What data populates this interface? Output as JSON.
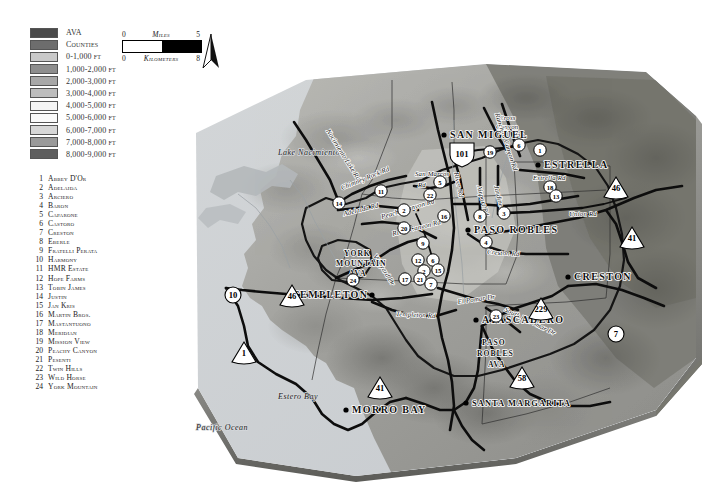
{
  "legend": {
    "title": "Map Legend",
    "items": [
      {
        "label": "AVA",
        "color": "#4a4a4a"
      },
      {
        "label": "Counties",
        "color": "#6d6d6d"
      },
      {
        "label": "0-1,000 ft",
        "color": "#c9c9c9"
      },
      {
        "label": "1,000-2,000 ft",
        "color": "#8e8e8e"
      },
      {
        "label": "2,000-3,000 ft",
        "color": "#a8a8a8"
      },
      {
        "label": "3,000-4,000 ft",
        "color": "#bdbdbd"
      },
      {
        "label": "4,000-5,000 ft",
        "color": "#f4f4f4"
      },
      {
        "label": "5,000-6,000 ft",
        "color": "#fafafa"
      },
      {
        "label": "6,000-7,000 ft",
        "color": "#d7d7d7"
      },
      {
        "label": "7,000-8,000 ft",
        "color": "#9a9a9a"
      },
      {
        "label": "8,000-9,000 ft",
        "color": "#5e5e5e"
      }
    ]
  },
  "scalebar": {
    "miles_min": "0",
    "miles_label": "Miles",
    "miles_max": "5",
    "km_min": "0",
    "km_label": "Kilometers",
    "km_max": "8"
  },
  "north_arrow": {
    "name": "north-arrow"
  },
  "wineries": [
    {
      "num": "1",
      "name": "Abbey D'Or"
    },
    {
      "num": "2",
      "name": "Adelaida"
    },
    {
      "num": "3",
      "name": "Arciero"
    },
    {
      "num": "4",
      "name": "Baron"
    },
    {
      "num": "5",
      "name": "Caparone"
    },
    {
      "num": "6",
      "name": "Castoro"
    },
    {
      "num": "7",
      "name": "Creston"
    },
    {
      "num": "8",
      "name": "Eberle"
    },
    {
      "num": "9",
      "name": "Fratelli Perata"
    },
    {
      "num": "10",
      "name": "Harmony"
    },
    {
      "num": "11",
      "name": "HMR Estate"
    },
    {
      "num": "12",
      "name": "Hope Farms"
    },
    {
      "num": "13",
      "name": "Tobin James"
    },
    {
      "num": "14",
      "name": "Justin"
    },
    {
      "num": "15",
      "name": "Jan Kris"
    },
    {
      "num": "16",
      "name": "Martin Bros."
    },
    {
      "num": "17",
      "name": "Mastantuono"
    },
    {
      "num": "18",
      "name": "Meridian"
    },
    {
      "num": "19",
      "name": "Mission View"
    },
    {
      "num": "20",
      "name": "Peachy Canyon"
    },
    {
      "num": "21",
      "name": "Pesenti"
    },
    {
      "num": "22",
      "name": "Twin Hills"
    },
    {
      "num": "23",
      "name": "Wild Horse"
    },
    {
      "num": "24",
      "name": "York Mountain"
    }
  ],
  "map": {
    "cities": [
      {
        "name": "SAN MIGUEL",
        "x": 258,
        "y": 80,
        "size": "large",
        "dot": true,
        "dx": 6
      },
      {
        "name": "ESTRELLA",
        "x": 352,
        "y": 110,
        "size": "large",
        "dot": true,
        "dx": 6
      },
      {
        "name": "PASO ROBLES",
        "x": 282,
        "y": 175,
        "size": "large",
        "dot": true,
        "dx": 6
      },
      {
        "name": "TEMPLETON",
        "x": 186,
        "y": 240,
        "size": "large",
        "dot": true,
        "dx": -80
      },
      {
        "name": "CRESTON",
        "x": 382,
        "y": 222,
        "size": "large",
        "dot": true,
        "dx": 6
      },
      {
        "name": "ATASCADERO",
        "x": 290,
        "y": 265,
        "size": "large",
        "dot": true,
        "dx": 6
      },
      {
        "name": "MORRO BAY",
        "x": 160,
        "y": 355,
        "size": "large",
        "dot": true,
        "dx": 6
      },
      {
        "name": "SANTA MARGARITA",
        "x": 280,
        "y": 348,
        "size": "small",
        "dot": true,
        "dx": 6
      }
    ],
    "water_labels": [
      {
        "name": "Lake Nacimiento",
        "x": 92,
        "y": 97,
        "rot": 0
      },
      {
        "name": "Estero Bay",
        "x": 92,
        "y": 341,
        "rot": 0
      },
      {
        "name": "Pacific Ocean",
        "x": 10,
        "y": 372,
        "rot": 0
      }
    ],
    "ava_labels": [
      {
        "name": "YORK",
        "x": 158,
        "y": 198
      },
      {
        "name": "MOUNTAIN",
        "x": 150,
        "y": 208
      },
      {
        "name": "AVA",
        "x": 163,
        "y": 218
      },
      {
        "name": "PASO",
        "x": 296,
        "y": 287
      },
      {
        "name": "ROBLES",
        "x": 291,
        "y": 298
      },
      {
        "name": "AVA",
        "x": 302,
        "y": 309
      }
    ],
    "road_labels": [
      {
        "name": "Nacimiento Lake Rd",
        "x": 140,
        "y": 73,
        "rot": 58
      },
      {
        "name": "Chimney Rock Rd",
        "x": 156,
        "y": 132,
        "rot": -22
      },
      {
        "name": "Adelaida Rd",
        "x": 158,
        "y": 158,
        "rot": -14
      },
      {
        "name": "Peachy Canyon Rd",
        "x": 196,
        "y": 161,
        "rot": -17
      },
      {
        "name": "San Marcos",
        "x": 229,
        "y": 118,
        "rot": 0
      },
      {
        "name": "Rd",
        "x": 232,
        "y": 129,
        "rot": 0
      },
      {
        "name": "Cross",
        "x": 313,
        "y": 62,
        "rot": 0
      },
      {
        "name": "Canyon",
        "x": 310,
        "y": 71,
        "rot": 0
      },
      {
        "name": "Rd",
        "x": 330,
        "y": 80,
        "rot": 0
      },
      {
        "name": "Ranchita Canyon Rd",
        "x": 309,
        "y": 56,
        "rot": 72
      },
      {
        "name": "River Rd",
        "x": 268,
        "y": 115,
        "rot": 78
      },
      {
        "name": "Airport Rd",
        "x": 291,
        "y": 128,
        "rot": 76
      },
      {
        "name": "Jardine Rd",
        "x": 308,
        "y": 128,
        "rot": 76
      },
      {
        "name": "Estrella Rd",
        "x": 347,
        "y": 122,
        "rot": 0
      },
      {
        "name": "Union Rd",
        "x": 383,
        "y": 158,
        "rot": 0
      },
      {
        "name": "Creston Rd",
        "x": 301,
        "y": 196,
        "rot": 4
      },
      {
        "name": "River Canyon Rd",
        "x": 207,
        "y": 178,
        "rot": -14
      },
      {
        "name": "Vineyard Dr",
        "x": 187,
        "y": 198,
        "rot": 58
      },
      {
        "name": "El Pomar Dr",
        "x": 272,
        "y": 246,
        "rot": -8
      },
      {
        "name": "South El Pomar Dr",
        "x": 318,
        "y": 253,
        "rot": 26
      },
      {
        "name": "Templeton Rd",
        "x": 210,
        "y": 258,
        "rot": 3
      }
    ],
    "highway_shields": [
      {
        "num": "101",
        "x": 276,
        "y": 96,
        "shape": "us"
      },
      {
        "num": "46",
        "x": 430,
        "y": 130,
        "shape": "state"
      },
      {
        "num": "41",
        "x": 446,
        "y": 180,
        "shape": "state"
      },
      {
        "num": "229",
        "x": 355,
        "y": 251,
        "shape": "state"
      },
      {
        "num": "58",
        "x": 336,
        "y": 320,
        "shape": "state"
      },
      {
        "num": "7",
        "x": 430,
        "y": 276,
        "shape": "circle"
      },
      {
        "num": "46",
        "x": 106,
        "y": 238,
        "shape": "state"
      },
      {
        "num": "10",
        "x": 47,
        "y": 237,
        "shape": "circle"
      },
      {
        "num": "1",
        "x": 58,
        "y": 295,
        "shape": "state"
      },
      {
        "num": "41",
        "x": 194,
        "y": 330,
        "shape": "state"
      }
    ],
    "winery_markers": [
      {
        "num": "14",
        "x": 153,
        "y": 145
      },
      {
        "num": "11",
        "x": 195,
        "y": 133
      },
      {
        "num": "2",
        "x": 218,
        "y": 152
      },
      {
        "num": "5",
        "x": 254,
        "y": 124
      },
      {
        "num": "22",
        "x": 244,
        "y": 137
      },
      {
        "num": "19",
        "x": 304,
        "y": 94
      },
      {
        "num": "6",
        "x": 333,
        "y": 87
      },
      {
        "num": "1",
        "x": 354,
        "y": 92
      },
      {
        "num": "18",
        "x": 364,
        "y": 129
      },
      {
        "num": "13",
        "x": 370,
        "y": 138
      },
      {
        "num": "16",
        "x": 258,
        "y": 158
      },
      {
        "num": "8",
        "x": 294,
        "y": 158
      },
      {
        "num": "3",
        "x": 318,
        "y": 155
      },
      {
        "num": "4",
        "x": 300,
        "y": 184
      },
      {
        "num": "9",
        "x": 237,
        "y": 185
      },
      {
        "num": "20",
        "x": 218,
        "y": 170
      },
      {
        "num": "12",
        "x": 232,
        "y": 202
      },
      {
        "num": "6",
        "x": 247,
        "y": 202
      },
      {
        "num": "2",
        "x": 238,
        "y": 213
      },
      {
        "num": "15",
        "x": 252,
        "y": 212
      },
      {
        "num": "17",
        "x": 219,
        "y": 221
      },
      {
        "num": "21",
        "x": 234,
        "y": 221
      },
      {
        "num": "7",
        "x": 245,
        "y": 226
      },
      {
        "num": "24",
        "x": 167,
        "y": 222
      },
      {
        "num": "23",
        "x": 310,
        "y": 258
      }
    ]
  }
}
